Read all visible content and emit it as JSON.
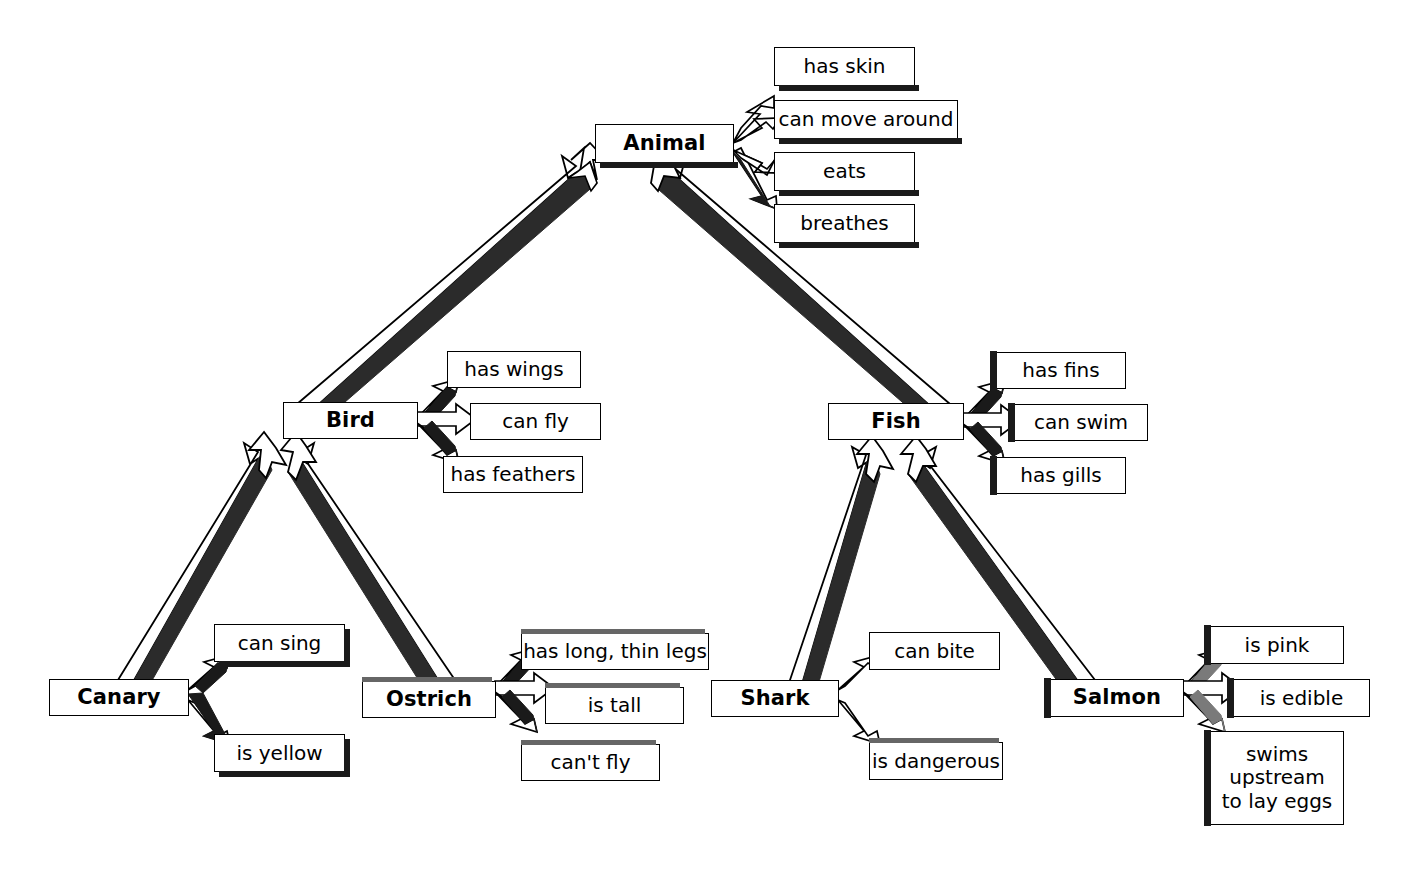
{
  "diagram": {
    "type": "semantic-network",
    "link_kinds": {
      "isa": "is-a (hollow 3D arrow pointing to superordinate concept)",
      "property": "has-property (hollow 3D arrow pointing to attribute box)"
    },
    "colors": {
      "box_fill": "#ffffff",
      "box_stroke": "#000000",
      "shadow": "#1a1a1a",
      "shadow_grey": "#666666",
      "background": "#ffffff",
      "text": "#000000"
    }
  },
  "concepts": [
    {
      "id": "animal",
      "label": "Animal",
      "level": 0
    },
    {
      "id": "bird",
      "label": "Bird",
      "level": 1
    },
    {
      "id": "fish",
      "label": "Fish",
      "level": 1
    },
    {
      "id": "canary",
      "label": "Canary",
      "level": 2
    },
    {
      "id": "ostrich",
      "label": "Ostrich",
      "level": 2
    },
    {
      "id": "shark",
      "label": "Shark",
      "level": 2
    },
    {
      "id": "salmon",
      "label": "Salmon",
      "level": 2
    }
  ],
  "properties": {
    "animal": [
      {
        "id": "has-skin",
        "label": "has skin"
      },
      {
        "id": "can-move-around",
        "label": "can move around"
      },
      {
        "id": "eats",
        "label": "eats"
      },
      {
        "id": "breathes",
        "label": "breathes"
      }
    ],
    "bird": [
      {
        "id": "has-wings",
        "label": "has wings"
      },
      {
        "id": "can-fly",
        "label": "can fly"
      },
      {
        "id": "has-feathers",
        "label": "has feathers"
      }
    ],
    "fish": [
      {
        "id": "has-fins",
        "label": "has fins"
      },
      {
        "id": "can-swim",
        "label": "can swim"
      },
      {
        "id": "has-gills",
        "label": "has gills"
      }
    ],
    "canary": [
      {
        "id": "can-sing",
        "label": "can sing"
      },
      {
        "id": "is-yellow",
        "label": "is yellow"
      }
    ],
    "ostrich": [
      {
        "id": "has-long-thin-legs",
        "label": "has long, thin legs"
      },
      {
        "id": "is-tall",
        "label": "is tall"
      },
      {
        "id": "cant-fly",
        "label": "can't fly"
      }
    ],
    "shark": [
      {
        "id": "can-bite",
        "label": "can bite"
      },
      {
        "id": "is-dangerous",
        "label": "is dangerous"
      }
    ],
    "salmon": [
      {
        "id": "is-pink",
        "label": "is pink"
      },
      {
        "id": "is-edible",
        "label": "is edible"
      },
      {
        "id": "swims-upstream-to-lay-eggs",
        "label": "swims\nupstream\nto lay eggs",
        "lines": [
          "swims",
          "upstream",
          "to lay eggs"
        ]
      }
    ]
  },
  "isa_links": [
    {
      "from": "bird",
      "to": "animal"
    },
    {
      "from": "fish",
      "to": "animal"
    },
    {
      "from": "canary",
      "to": "bird"
    },
    {
      "from": "ostrich",
      "to": "bird"
    },
    {
      "from": "shark",
      "to": "fish"
    },
    {
      "from": "salmon",
      "to": "fish"
    }
  ]
}
